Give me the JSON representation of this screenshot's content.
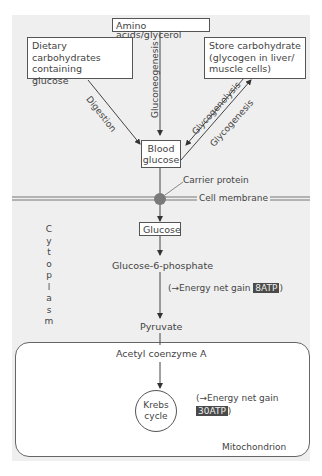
{
  "diagram": {
    "sources": {
      "amino": "Amino acids/glycerol",
      "dietary": [
        "Dietary carbohydrates",
        "containing",
        "glucose"
      ],
      "store": [
        "Store carbohydrate",
        "(glycogen in liver/",
        "muscle cells)"
      ]
    },
    "processes": {
      "digestion": "Digestion",
      "gluconeogenesis": "Gluconeogenesis",
      "glycogenolysis": "Glycogenolysis",
      "glycogenesis": "Glycogenesis"
    },
    "blood_glucose": [
      "Blood",
      "glucose"
    ],
    "carrier_protein": "Carrier protein",
    "cell_membrane": "Cell membrane",
    "cytoplasm_letters": [
      "C",
      "y",
      "t",
      "o",
      "p",
      "l",
      "a",
      "s",
      "m"
    ],
    "glucose": "Glucose",
    "g6p": "Glucose-6-phosphate",
    "energy1": {
      "prefix": "(→Energy net gain ",
      "atp": "8ATP",
      "suffix": ")"
    },
    "pyruvate": "Pyruvate",
    "acetyl": "Acetyl coenzyme A",
    "krebs": [
      "Krebs",
      "cycle"
    ],
    "energy2": {
      "line1": "(→Energy net gain",
      "atp": "30ATP",
      "suffix": ")"
    },
    "mitochondrion": "Mitochondrion",
    "colors": {
      "panel": "#efefef",
      "atp_bg": "#4a4a4a",
      "carrier": "#7a7a7a"
    }
  }
}
